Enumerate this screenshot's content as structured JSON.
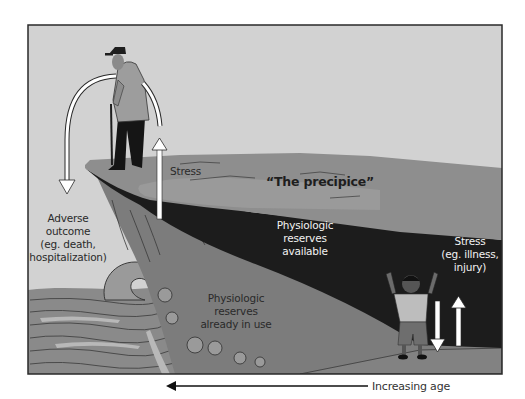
{
  "figure": {
    "title_label": "“The precipice”",
    "labels": {
      "stress_top": "Stress",
      "adverse_outcome": [
        "Adverse",
        "outcome",
        "(eg. death,",
        "hospitalization)"
      ],
      "reserves_available": [
        "Physiologic",
        "reserves",
        "available"
      ],
      "reserves_in_use": [
        "Physiologic",
        "reserves",
        "already in use"
      ],
      "stress_right": [
        "Stress",
        "(eg. illness,",
        "injury)"
      ]
    },
    "axis": {
      "label": "Increasing age",
      "direction": "left"
    },
    "figures": {
      "elderly_person": "elderly man with cane standing at cliff edge",
      "child": "child with raised arms at low end of slope"
    },
    "arrows": {
      "elderly_stress_up": "up",
      "elderly_fall_arc": "down",
      "child_stress_down": "down",
      "child_stress_up": "up"
    },
    "colors": {
      "sky": "#d2d2d2",
      "cliff_top": "#8e8e8e",
      "reserves_dark": "#1c1c1c",
      "cliff_face": "#7a7a7a",
      "sea": "#8a8a8a",
      "sea_light": "#b5b5b5",
      "frame": "#2a2a2a",
      "arrow": "#ffffff"
    }
  }
}
